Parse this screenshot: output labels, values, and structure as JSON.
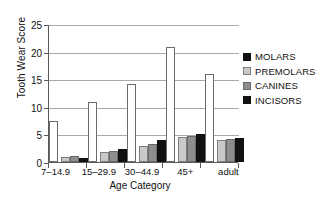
{
  "chart_data": {
    "type": "bar",
    "title": "",
    "xlabel": "Age Category",
    "ylabel": "Tooth Wear Score",
    "categories": [
      "7–14.9",
      "15–29.9",
      "30–44.9",
      "45+",
      "adult"
    ],
    "series": [
      {
        "name": "MOLARS",
        "color": "#ffffff",
        "values": [
          7.5,
          10.8,
          14.2,
          20.9,
          16.0
        ]
      },
      {
        "name": "PREMOLARS",
        "color": "#c9c9c9",
        "values": [
          0.9,
          1.9,
          2.9,
          4.6,
          4.0
        ]
      },
      {
        "name": "CANINES",
        "color": "#8e8e8e",
        "values": [
          1.1,
          2.0,
          3.2,
          4.7,
          4.2
        ]
      },
      {
        "name": "INCISORS",
        "color": "#111111",
        "values": [
          0.8,
          2.3,
          4.0,
          5.0,
          4.4
        ]
      }
    ],
    "ylim": [
      0,
      25
    ],
    "yticks": [
      0,
      5,
      10,
      15,
      20,
      25
    ],
    "ytick_labels": [
      "0",
      "5",
      "10",
      "15",
      "20",
      "25"
    ],
    "grid": true,
    "grid_axis": "y",
    "legend_position": "right",
    "legend_entries": [
      "MOLARS",
      "PREMOLARS",
      "CANINES",
      "INCISORS"
    ]
  }
}
